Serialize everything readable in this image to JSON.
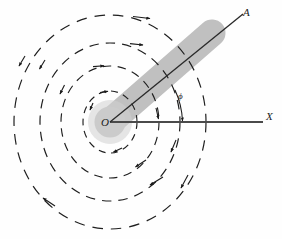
{
  "figure": {
    "background_color": "#fefefe",
    "labels": {
      "origin": "O",
      "beam_end": "A",
      "axis": "X",
      "angle": "ϕ"
    },
    "colors": {
      "stroke": "#1b1b1b",
      "beam_fill": "#bfbfbf",
      "wavefront": "#1f1f1f"
    },
    "geometry": {
      "center_x": 110,
      "center_y": 122,
      "beam_angle_deg": 41,
      "beam_width": 26,
      "beam_length": 136,
      "axis_end_x": 262,
      "wavefronts": [
        {
          "rx": 27,
          "ry": 31,
          "dash": "7 5"
        },
        {
          "rx": 49,
          "ry": 56,
          "dash": "8 6"
        },
        {
          "rx": 70,
          "ry": 79,
          "dash": "9 7"
        },
        {
          "rx": 96,
          "ry": 107,
          "dash": "10 8"
        }
      ],
      "arrow_markers": 13
    },
    "elements": {
      "beam": "shaded-beam",
      "ray": "ray-OA",
      "axis": "x-axis",
      "angle_arc": "angle-arc-phi"
    }
  }
}
